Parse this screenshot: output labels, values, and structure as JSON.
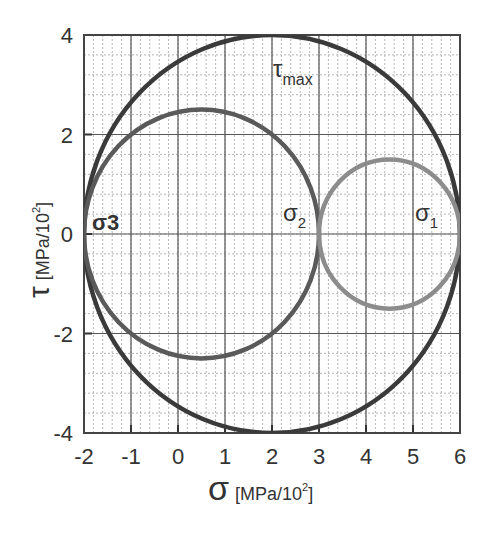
{
  "chart_data": {
    "type": "line",
    "xlabel": "σ",
    "xlabel_unit": "[MPa/10²]",
    "ylabel": "τ",
    "ylabel_unit": "[MPa/10²]",
    "xlim": [
      -2,
      6
    ],
    "ylim": [
      -4,
      4
    ],
    "x_ticks": [
      "-2",
      "-1",
      "0",
      "1",
      "2",
      "3",
      "4",
      "5",
      "6"
    ],
    "y_ticks": [
      "4",
      "2",
      "0",
      "-2",
      "-4"
    ],
    "grid": true,
    "series": [
      {
        "name": "Circle σ3–σ1 (τmax)",
        "center": [
          2,
          0
        ],
        "radius": 4,
        "color": "#3a3a3a"
      },
      {
        "name": "Circle σ3–σ2",
        "center": [
          0.5,
          0
        ],
        "radius": 2.5,
        "color": "#5a5a5a"
      },
      {
        "name": "Circle σ2–σ1",
        "center": [
          4.5,
          0
        ],
        "radius": 1.5,
        "color": "#8c8c8c"
      }
    ],
    "annotations": [
      {
        "text": "τmax",
        "x": 1.9,
        "y": 3.3
      },
      {
        "text": "σ3",
        "x": -1.8,
        "y": 0.2
      },
      {
        "text": "σ2",
        "x": 2.6,
        "y": 0.2
      },
      {
        "text": "σ1",
        "x": 5.4,
        "y": 0.2
      }
    ],
    "principal_stresses": {
      "sigma1": 6,
      "sigma2": 3,
      "sigma3": -2,
      "tau_max": 4
    }
  },
  "labels": {
    "tau_max_main": "τ",
    "tau_max_sub": "max",
    "sigma3": "σ3",
    "sigma2_main": "σ",
    "sigma2_sub": "2",
    "sigma1_main": "σ",
    "sigma1_sub": "1",
    "x_symbol": "σ",
    "x_unit": "[MPa/10",
    "x_unit_sup": "2",
    "x_unit_end": "]",
    "y_symbol": "τ",
    "y_unit": "[MPa/10",
    "y_unit_sup": "2",
    "y_unit_end": "]"
  }
}
